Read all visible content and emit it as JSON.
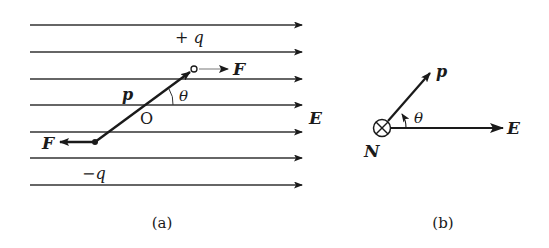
{
  "figure_a": {
    "caption": "(a)",
    "field_label": "E",
    "field_line_count": 7,
    "charge_positive_label": "+ q",
    "charge_negative_label": "−q",
    "dipole_label": "p",
    "center_label": "O",
    "angle_label": "θ",
    "force_label_right": "F",
    "force_label_left": "F"
  },
  "figure_b": {
    "caption": "(b)",
    "dipole_label": "p",
    "angle_label": "θ",
    "field_label": "E",
    "torque_label": "N",
    "torque_symbol": "into-page (⊗)"
  },
  "colors": {
    "ink": "#1a1a1a",
    "background": "#ffffff"
  }
}
